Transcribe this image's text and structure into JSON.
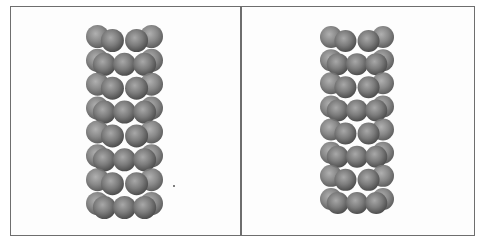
{
  "figure": {
    "panels": [
      {
        "id": "left",
        "label": "",
        "structure": "sphere-packed nanotube cluster",
        "layers": 8,
        "bounds": {
          "x": 86,
          "y": 27,
          "w": 77,
          "h": 190
        },
        "sphere_radius": 11.5
      },
      {
        "id": "right",
        "label": "",
        "structure": "sphere-packed nanotube cluster",
        "layers": 8,
        "bounds": {
          "x": 320,
          "y": 28,
          "w": 74,
          "h": 184
        },
        "sphere_radius": 11
      }
    ],
    "colors": {
      "border": "#6e6e6e",
      "sphere_light": "#a8a8a8",
      "sphere_mid": "#7c7c7c",
      "sphere_dark": "#4e4e4e",
      "background": "#fdfdfd"
    }
  }
}
